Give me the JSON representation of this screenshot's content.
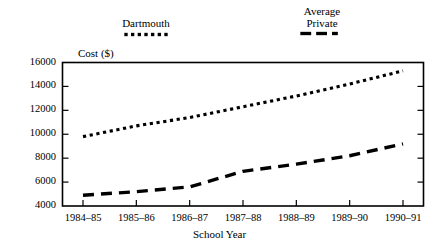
{
  "chart_data": {
    "type": "line",
    "title": "",
    "xlabel": "School Year",
    "ylabel": "Cost ($)",
    "categories": [
      "1984–85",
      "1985–86",
      "1986–87",
      "1987–88",
      "1988–89",
      "1989–90",
      "1990–91"
    ],
    "ylim": [
      4000,
      16000
    ],
    "yticks": [
      4000,
      6000,
      8000,
      10000,
      12000,
      14000,
      16000
    ],
    "ytick_labels": [
      "4000",
      "6000",
      "8000",
      "10000",
      "12000",
      "14000",
      "16000"
    ],
    "grid": false,
    "legend_position": "above-plot",
    "series": [
      {
        "name": "Dartmouth",
        "style": "dotted",
        "color": "#000000",
        "values": [
          9800,
          10700,
          11400,
          12300,
          13200,
          14200,
          15300
        ]
      },
      {
        "name": "Average Private",
        "style": "dashed",
        "color": "#000000",
        "values": [
          4900,
          5200,
          5600,
          6900,
          7500,
          8200,
          9200
        ]
      }
    ]
  },
  "legend": {
    "dartmouth": {
      "label": "Dartmouth"
    },
    "average_private": {
      "label_line1": "Average",
      "label_line2": "Private"
    }
  },
  "axes": {
    "y_axis_title": "Cost ($)",
    "x_axis_title": "School Year"
  }
}
